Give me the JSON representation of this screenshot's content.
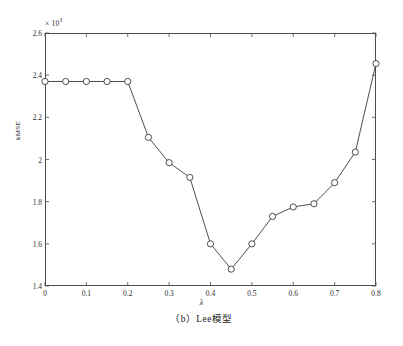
{
  "chart_data": {
    "type": "line",
    "title": "",
    "subtitle": "",
    "xlabel": "λ",
    "ylabel": "kMSE",
    "y_exponent_label": "× 10",
    "y_exponent_power": "3",
    "xlim": [
      0,
      0.8
    ],
    "ylim": [
      1.4,
      2.6
    ],
    "xticks": [
      0,
      0.1,
      0.2,
      0.3,
      0.4,
      0.5,
      0.6,
      0.7,
      0.8
    ],
    "xtick_labels": [
      "0",
      "0.1",
      "0.2",
      "0.3",
      "0.4",
      "0.5",
      "0.6",
      "0.7",
      "0.8"
    ],
    "yticks": [
      1.4,
      1.6,
      1.8,
      2.0,
      2.2,
      2.4,
      2.6
    ],
    "ytick_labels": [
      "1.4",
      "1.6",
      "1.8",
      "2",
      "2.2",
      "2.4",
      "2.6"
    ],
    "grid": false,
    "legend": null,
    "marker": "circle-open",
    "line_color": "#3a3a3a",
    "marker_color": "#3a3a3a",
    "x": [
      0,
      0.05,
      0.1,
      0.15,
      0.2,
      0.25,
      0.3,
      0.35,
      0.4,
      0.45,
      0.5,
      0.55,
      0.6,
      0.65,
      0.7,
      0.75,
      0.8
    ],
    "y": [
      2.37,
      2.37,
      2.37,
      2.37,
      2.37,
      2.105,
      1.985,
      1.915,
      1.6,
      1.48,
      1.6,
      1.73,
      1.775,
      1.79,
      1.89,
      2.035,
      2.455
    ],
    "series": [
      {
        "name": "kMSE",
        "x": [
          0,
          0.05,
          0.1,
          0.15,
          0.2,
          0.25,
          0.3,
          0.35,
          0.4,
          0.45,
          0.5,
          0.55,
          0.6,
          0.65,
          0.7,
          0.75,
          0.8
        ],
        "values": [
          2.37,
          2.37,
          2.37,
          2.37,
          2.37,
          2.105,
          1.985,
          1.915,
          1.6,
          1.48,
          1.6,
          1.73,
          1.775,
          1.79,
          1.89,
          2.035,
          2.455
        ]
      }
    ],
    "annotations": []
  },
  "caption": {
    "text": "（b）Lee模型"
  }
}
